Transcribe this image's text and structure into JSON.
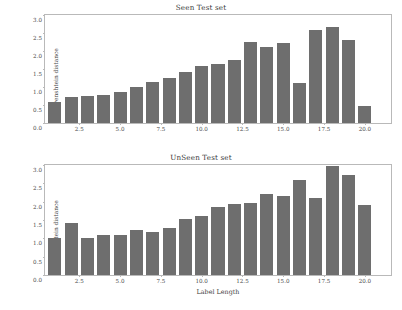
{
  "chart_data": [
    {
      "type": "bar",
      "title": "Seen Test set",
      "xlabel": "",
      "ylabel": "Levenshtein distance",
      "xlim": [
        0.4,
        21.6
      ],
      "ylim": [
        0.0,
        3.0
      ],
      "grid": false,
      "legend": null,
      "bar_color": "#6e6e6e",
      "xticks": [
        2.5,
        5.0,
        7.5,
        10.0,
        12.5,
        15.0,
        17.5,
        20.0
      ],
      "xtick_labels": [
        "2.5",
        "5.0",
        "7.5",
        "10.0",
        "12.5",
        "15.0",
        "17.5",
        "20.0"
      ],
      "yticks": [
        0.0,
        0.5,
        1.0,
        1.5,
        2.0,
        2.5,
        3.0
      ],
      "ytick_labels": [
        "0.0",
        "0.5",
        "1.0",
        "1.5",
        "2.0",
        "2.5",
        "3.0"
      ],
      "categories": [
        1,
        2,
        3,
        4,
        5,
        6,
        7,
        8,
        9,
        10,
        11,
        12,
        13,
        14,
        15,
        16,
        17,
        18,
        19,
        20,
        21
      ],
      "values": [
        0.59,
        0.72,
        0.74,
        0.79,
        0.85,
        1.01,
        1.13,
        1.24,
        1.43,
        1.57,
        1.63,
        1.74,
        2.26,
        2.1,
        2.21,
        1.11,
        2.58,
        2.67,
        2.31,
        0.47,
        0.0
      ]
    },
    {
      "type": "bar",
      "title": "UnSeen Test set",
      "xlabel": "Label Length",
      "ylabel": "Levenshtein distance",
      "xlim": [
        0.4,
        21.6
      ],
      "ylim": [
        0.0,
        3.0
      ],
      "grid": false,
      "legend": null,
      "bar_color": "#6e6e6e",
      "xticks": [
        2.5,
        5.0,
        7.5,
        10.0,
        12.5,
        15.0,
        17.5,
        20.0
      ],
      "xtick_labels": [
        "2.5",
        "5.0",
        "7.5",
        "10.0",
        "12.5",
        "15.0",
        "17.5",
        "20.0"
      ],
      "yticks": [
        0.0,
        0.5,
        1.0,
        1.5,
        2.0,
        2.5,
        3.0
      ],
      "ytick_labels": [
        "0.0",
        "0.5",
        "1.0",
        "1.5",
        "2.0",
        "2.5",
        "3.0"
      ],
      "categories": [
        1,
        2,
        3,
        4,
        5,
        6,
        7,
        8,
        9,
        10,
        11,
        12,
        13,
        14,
        15,
        16,
        17,
        18,
        19,
        20,
        21
      ],
      "values": [
        1.0,
        1.41,
        1.01,
        1.08,
        1.09,
        1.23,
        1.18,
        1.29,
        1.53,
        1.61,
        1.85,
        1.94,
        1.96,
        2.21,
        2.16,
        2.6,
        2.1,
        2.98,
        2.73,
        1.9,
        0.0
      ]
    }
  ]
}
